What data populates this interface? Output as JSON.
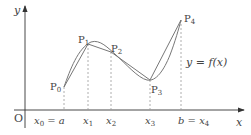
{
  "diagram": {
    "type": "function-curve-with-polyline-approximation",
    "axes": {
      "x_label": "x",
      "y_label": "y",
      "origin_label": "O"
    },
    "curve_label": "y = f(x)",
    "points": [
      {
        "label": "P0",
        "sub": "0",
        "base": "P",
        "x": 64,
        "y": 87
      },
      {
        "label": "P1",
        "sub": "1",
        "base": "P",
        "x": 88,
        "y": 44
      },
      {
        "label": "P2",
        "sub": "2",
        "base": "P",
        "x": 111,
        "y": 52
      },
      {
        "label": "P3",
        "sub": "3",
        "base": "P",
        "x": 150,
        "y": 80
      },
      {
        "label": "P4",
        "sub": "4",
        "base": "P",
        "x": 181,
        "y": 20
      }
    ],
    "x_ticks": [
      {
        "text": "x₀ = a",
        "x": 64
      },
      {
        "text": "x₁",
        "x": 88
      },
      {
        "text": "x₂",
        "x": 111
      },
      {
        "text": "x₃",
        "x": 150
      },
      {
        "text": "b = x₄",
        "x": 181
      }
    ],
    "colors": {
      "curve": "#777777",
      "axis": "#333333",
      "dashed": "#999999"
    }
  }
}
